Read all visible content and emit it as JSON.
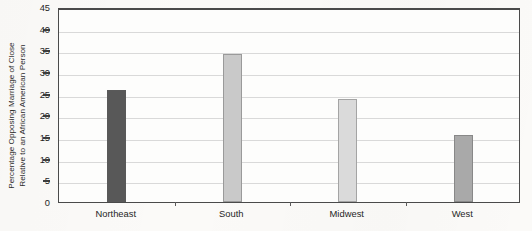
{
  "chart_data": {
    "type": "bar",
    "title": "",
    "subtitle": "",
    "xlabel": "",
    "ylabel": "Percentage Opposing Marriage of Close Relative to an African American Person",
    "ylabel_line1": "Percentage Opposing Marriage of Close",
    "ylabel_line2": "Relative to an African American Person",
    "categories": [
      "Northeast",
      "South",
      "Midwest",
      "West"
    ],
    "values": [
      25.8,
      34.2,
      23.8,
      15.4
    ],
    "ylim": [
      0,
      45
    ],
    "ytick_step": 5,
    "ytick_labels": [
      "0",
      "5",
      "10",
      "15",
      "20",
      "25",
      "30",
      "35",
      "40",
      "45"
    ],
    "ytick_values": [
      0,
      5,
      10,
      15,
      20,
      25,
      30,
      35,
      40,
      45
    ],
    "grid": true,
    "grid_axis": "y",
    "legend": false,
    "legend_position": "none",
    "bar_colors": [
      "#585858",
      "#c9c9c9",
      "#dadada",
      "#a9a9a9"
    ],
    "annotations": []
  },
  "figure": {
    "background_color": "#fbfaf8",
    "plot_background_color": "#fdfdfc",
    "axis_color": "#4a4a4a",
    "gridline_color": "#d9d9d9",
    "text_color": "#1f1f1f"
  }
}
